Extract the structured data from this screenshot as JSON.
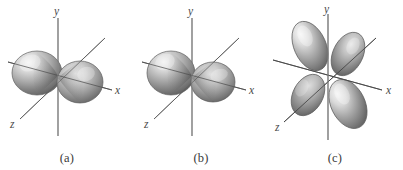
{
  "figure": {
    "type": "scientific-illustration",
    "background_color": "#ffffff",
    "panel_count": 3
  },
  "axes": {
    "y_label": "y",
    "x_label": "x",
    "z_label": "z",
    "axis_color": "#6a6a6a",
    "label_color": "#4a4a4a"
  },
  "orbital_colors": {
    "lobe_light": "#f2f2f2",
    "lobe_mid": "#b9b9b9",
    "lobe_dark": "#6e6e6e",
    "lobe_shadow": "#4f4f4f",
    "outline": "#5c5c5c"
  },
  "panels": [
    {
      "id": "a",
      "caption": "(a)",
      "lobe_count": 2,
      "axis_labels": {
        "x": "x",
        "y": "y",
        "z": "z"
      }
    },
    {
      "id": "b",
      "caption": "(b)",
      "lobe_count": 2,
      "axis_labels": {
        "x": "x",
        "y": "y",
        "z": "z"
      }
    },
    {
      "id": "c",
      "caption": "(c)",
      "lobe_count": 4,
      "axis_labels": {
        "x": "x",
        "y": "y",
        "z": "z"
      }
    }
  ]
}
